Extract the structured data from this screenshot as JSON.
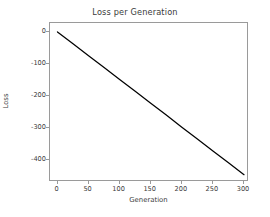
{
  "chart_data": {
    "type": "line",
    "title": "Loss per Generation",
    "xlabel": "Generation",
    "ylabel": "Loss",
    "xlim": [
      -12,
      308
    ],
    "ylim": [
      -468,
      28
    ],
    "grid": false,
    "legend": null,
    "line_color": "#000000",
    "x_ticks": [
      0,
      50,
      100,
      150,
      200,
      250,
      300
    ],
    "x_tick_labels": [
      "0",
      "50",
      "100",
      "150",
      "200",
      "250",
      "300"
    ],
    "y_ticks": [
      0,
      -100,
      -200,
      -300,
      -400
    ],
    "y_tick_labels": [
      "0",
      "-100",
      "-200",
      "-300",
      "-400"
    ],
    "series": [
      {
        "name": "Loss",
        "x": [
          0,
          25,
          50,
          75,
          100,
          125,
          150,
          175,
          200,
          225,
          250,
          275,
          300
        ],
        "values": [
          0,
          -37,
          -74,
          -111,
          -148,
          -185,
          -222,
          -259,
          -297,
          -334,
          -371,
          -408,
          -445
        ]
      }
    ]
  },
  "axis_color": "#9a9a9a",
  "text_color": "#3b3b3b",
  "background_color": "#ffffff"
}
